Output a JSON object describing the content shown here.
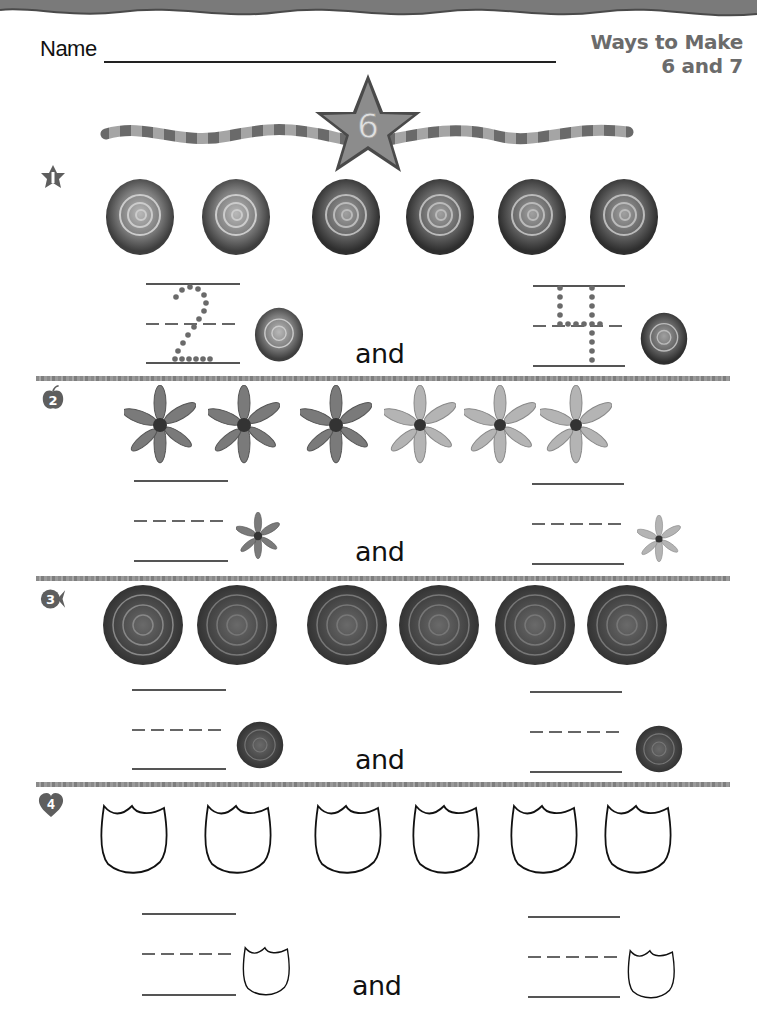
{
  "header": {
    "name_label": "Name",
    "title_line1": "Ways to Make",
    "title_line2": "6 and 7",
    "banner_number": "6"
  },
  "sections": [
    {
      "number": "1",
      "icon": "star-badge-icon",
      "flower": "rose",
      "count": 6,
      "left_answer": "2",
      "right_answer": "4",
      "conjunction": "and"
    },
    {
      "number": "2",
      "icon": "apple-badge-icon",
      "flower": "lily",
      "count": 6,
      "left_answer": "",
      "right_answer": "",
      "conjunction": "and"
    },
    {
      "number": "3",
      "icon": "fish-badge-icon",
      "flower": "dahlia",
      "count": 6,
      "left_answer": "",
      "right_answer": "",
      "conjunction": "and"
    },
    {
      "number": "4",
      "icon": "heart-badge-icon",
      "flower": "tulip-outline",
      "count": 6,
      "left_answer": "",
      "right_answer": "",
      "conjunction": "and"
    }
  ],
  "colors": {
    "title_gray": "#6b6b6b",
    "badge_gray": "#5e5e5e",
    "divider_gray": "#919191",
    "star_fill": "#8c8c8c"
  }
}
